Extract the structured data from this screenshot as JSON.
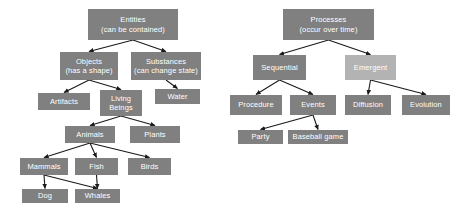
{
  "diagram": {
    "title_left": "Entities",
    "title_right": "Processes",
    "colors": {
      "node_fill": "#808080",
      "node_fill_light": "#b3b3b3",
      "node_text": "#ffffff",
      "edge": "#1a1a1a",
      "background": "#ffffff"
    },
    "nodes": [
      {
        "id": "entities",
        "label": "Entities\n(can be contained)",
        "x": 88,
        "y": 9,
        "w": 90,
        "h": 31,
        "tone": "dark"
      },
      {
        "id": "objects",
        "label": "Objects\n(has a shape)",
        "x": 60,
        "y": 52,
        "w": 58,
        "h": 28,
        "tone": "dark"
      },
      {
        "id": "substances",
        "label": "Substances\n(can change state)",
        "x": 131,
        "y": 52,
        "w": 70,
        "h": 28,
        "tone": "dark"
      },
      {
        "id": "artifacts",
        "label": "Artifacts",
        "x": 38,
        "y": 93,
        "w": 52,
        "h": 17,
        "tone": "dark"
      },
      {
        "id": "living-beings",
        "label": "Living\nBeings",
        "x": 100,
        "y": 90,
        "w": 42,
        "h": 26,
        "tone": "dark"
      },
      {
        "id": "water",
        "label": "Water",
        "x": 155,
        "y": 89,
        "w": 45,
        "h": 15,
        "tone": "dark"
      },
      {
        "id": "animals",
        "label": "Animals",
        "x": 65,
        "y": 126,
        "w": 50,
        "h": 17,
        "tone": "dark"
      },
      {
        "id": "plants",
        "label": "Plants",
        "x": 130,
        "y": 126,
        "w": 50,
        "h": 17,
        "tone": "dark"
      },
      {
        "id": "mammals",
        "label": "Mammals",
        "x": 20,
        "y": 158,
        "w": 48,
        "h": 17,
        "tone": "dark"
      },
      {
        "id": "fish",
        "label": "Fish",
        "x": 75,
        "y": 158,
        "w": 43,
        "h": 17,
        "tone": "dark"
      },
      {
        "id": "birds",
        "label": "Birds",
        "x": 128,
        "y": 158,
        "w": 43,
        "h": 17,
        "tone": "dark"
      },
      {
        "id": "dog",
        "label": "Dog",
        "x": 22,
        "y": 189,
        "w": 46,
        "h": 14,
        "tone": "dark"
      },
      {
        "id": "whales",
        "label": "Whales",
        "x": 75,
        "y": 189,
        "w": 45,
        "h": 14,
        "tone": "dark"
      },
      {
        "id": "processes",
        "label": "Processes\n(occur over time)",
        "x": 283,
        "y": 9,
        "w": 91,
        "h": 31,
        "tone": "dark"
      },
      {
        "id": "sequential",
        "label": "Sequential",
        "x": 253,
        "y": 55,
        "w": 53,
        "h": 25,
        "tone": "dark"
      },
      {
        "id": "emergent",
        "label": "Emergent",
        "x": 345,
        "y": 55,
        "w": 51,
        "h": 25,
        "tone": "light"
      },
      {
        "id": "procedure",
        "label": "Procedure",
        "x": 230,
        "y": 95,
        "w": 52,
        "h": 20,
        "tone": "dark"
      },
      {
        "id": "events",
        "label": "Events",
        "x": 290,
        "y": 95,
        "w": 46,
        "h": 20,
        "tone": "dark"
      },
      {
        "id": "diffusion",
        "label": "Diffusion",
        "x": 345,
        "y": 95,
        "w": 46,
        "h": 20,
        "tone": "dark"
      },
      {
        "id": "evolution",
        "label": "Evolution",
        "x": 402,
        "y": 95,
        "w": 48,
        "h": 20,
        "tone": "dark"
      },
      {
        "id": "party",
        "label": "Party",
        "x": 238,
        "y": 130,
        "w": 45,
        "h": 14,
        "tone": "dark"
      },
      {
        "id": "baseball-game",
        "label": "Baseball game",
        "x": 288,
        "y": 130,
        "w": 60,
        "h": 14,
        "tone": "dark"
      }
    ],
    "edges": [
      {
        "from": "entities",
        "to": "objects"
      },
      {
        "from": "entities",
        "to": "substances"
      },
      {
        "from": "objects",
        "to": "artifacts"
      },
      {
        "from": "objects",
        "to": "living-beings"
      },
      {
        "from": "substances",
        "to": "water"
      },
      {
        "from": "living-beings",
        "to": "animals"
      },
      {
        "from": "living-beings",
        "to": "plants"
      },
      {
        "from": "animals",
        "to": "mammals"
      },
      {
        "from": "animals",
        "to": "fish"
      },
      {
        "from": "animals",
        "to": "birds"
      },
      {
        "from": "mammals",
        "to": "dog"
      },
      {
        "from": "mammals",
        "to": "whales"
      },
      {
        "from": "fish",
        "to": "whales"
      },
      {
        "from": "processes",
        "to": "sequential"
      },
      {
        "from": "processes",
        "to": "emergent"
      },
      {
        "from": "sequential",
        "to": "procedure"
      },
      {
        "from": "sequential",
        "to": "events"
      },
      {
        "from": "emergent",
        "to": "diffusion"
      },
      {
        "from": "emergent",
        "to": "evolution"
      },
      {
        "from": "events",
        "to": "party"
      },
      {
        "from": "events",
        "to": "baseball-game"
      }
    ]
  }
}
